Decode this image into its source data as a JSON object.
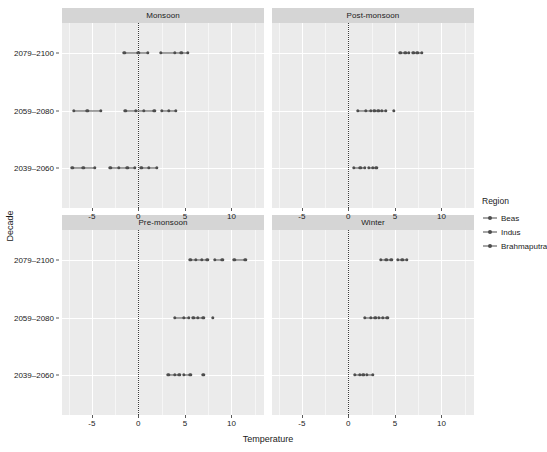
{
  "chart_data": {
    "type": "scatter",
    "title": "",
    "xlabel": "Temperature",
    "ylabel": "Decade",
    "xlim": [
      -8.2,
      13.5
    ],
    "ylim_categories": [
      "2039-2060",
      "2059-2080",
      "2079-2100"
    ],
    "xticks": [
      -5,
      0,
      5,
      10
    ],
    "xtick_labels": [
      "-5",
      "0",
      "5",
      "10"
    ],
    "yticks": [
      "2039–2060",
      "2059–2080",
      "2079–2100"
    ],
    "grid": true,
    "legend_position": "right",
    "legend_title": "Region",
    "reference_line": {
      "x": 0,
      "style": "dotted"
    },
    "facets": [
      {
        "label": "Monsoon",
        "row": 0,
        "col": 0,
        "rows": [
          {
            "decade": "2079–2100",
            "series": [
              {
                "name": "Beas",
                "values": [
                  -1.5,
                  0.0,
                  1.0
                ]
              },
              {
                "name": "Indus",
                "values": [
                  2.4,
                  3.9,
                  4.6,
                  5.3
                ]
              }
            ]
          },
          {
            "decade": "2059–2080",
            "series": [
              {
                "name": "Beas",
                "values": [
                  -6.9,
                  -5.5,
                  -4.0
                ]
              },
              {
                "name": "Indus",
                "values": [
                  -1.4,
                  -0.3,
                  0.6,
                  1.7
                ]
              },
              {
                "name": "Brahmaputra",
                "values": [
                  2.5,
                  3.3,
                  4.0
                ]
              }
            ]
          },
          {
            "decade": "2039–2060",
            "series": [
              {
                "name": "Beas",
                "values": [
                  -7.1,
                  -5.9,
                  -4.7
                ]
              },
              {
                "name": "Indus",
                "values": [
                  -3.0,
                  -2.1,
                  -1.2,
                  -0.4
                ]
              },
              {
                "name": "Brahmaputra",
                "values": [
                  0.3,
                  1.1,
                  2.0
                ]
              }
            ]
          }
        ]
      },
      {
        "label": "Post-monsoon",
        "row": 0,
        "col": 1,
        "rows": [
          {
            "decade": "2079–2100",
            "series": [
              {
                "name": "Beas",
                "values": [
                  5.6,
                  6.1,
                  6.5
                ]
              },
              {
                "name": "Indus",
                "values": [
                  7.0,
                  7.4,
                  7.9
                ]
              }
            ]
          },
          {
            "decade": "2059–2080",
            "series": [
              {
                "name": "Beas",
                "values": [
                  1.0,
                  1.9,
                  2.4
                ]
              },
              {
                "name": "Indus",
                "values": [
                  2.8,
                  3.2,
                  3.6,
                  4.0
                ]
              },
              {
                "name": "Brahmaputra",
                "values": [
                  4.9
                ]
              }
            ]
          },
          {
            "decade": "2039–2060",
            "series": [
              {
                "name": "Beas",
                "values": [
                  0.6,
                  1.3,
                  1.8
                ]
              },
              {
                "name": "Indus",
                "values": [
                  2.2,
                  2.6,
                  3.0
                ]
              }
            ]
          }
        ]
      },
      {
        "label": "Pre-monsoon",
        "row": 1,
        "col": 0,
        "rows": [
          {
            "decade": "2079–2100",
            "series": [
              {
                "name": "Beas",
                "values": [
                  5.6,
                  6.2,
                  6.8,
                  7.4
                ]
              },
              {
                "name": "Indus",
                "values": [
                  8.2,
                  9.0
                ]
              },
              {
                "name": "Brahmaputra",
                "values": [
                  10.3,
                  11.5
                ]
              }
            ]
          },
          {
            "decade": "2059–2080",
            "series": [
              {
                "name": "Beas",
                "values": [
                  3.9,
                  4.9,
                  5.4
                ]
              },
              {
                "name": "Indus",
                "values": [
                  5.9,
                  6.4,
                  7.0
                ]
              },
              {
                "name": "Brahmaputra",
                "values": [
                  8.0
                ]
              }
            ]
          },
          {
            "decade": "2039–2060",
            "series": [
              {
                "name": "Beas",
                "values": [
                  3.2,
                  3.9,
                  4.4
                ]
              },
              {
                "name": "Indus",
                "values": [
                  4.9,
                  5.6
                ]
              },
              {
                "name": "Brahmaputra",
                "values": [
                  7.0
                ]
              }
            ]
          }
        ]
      },
      {
        "label": "Winter",
        "row": 1,
        "col": 1,
        "rows": [
          {
            "decade": "2079–2100",
            "series": [
              {
                "name": "Beas",
                "values": [
                  3.5,
                  4.1,
                  4.6
                ]
              },
              {
                "name": "Indus",
                "values": [
                  5.3,
                  5.8,
                  6.3
                ]
              }
            ]
          },
          {
            "decade": "2059–2080",
            "series": [
              {
                "name": "Beas",
                "values": [
                  1.8,
                  2.4,
                  2.9
                ]
              },
              {
                "name": "Indus",
                "values": [
                  3.3,
                  3.7,
                  4.2
                ]
              }
            ]
          },
          {
            "decade": "2039–2060",
            "series": [
              {
                "name": "Beas",
                "values": [
                  0.7,
                  1.2,
                  1.6
                ]
              },
              {
                "name": "Indus",
                "values": [
                  2.0,
                  2.6
                ]
              }
            ]
          }
        ]
      }
    ]
  },
  "legend": {
    "title": "Region",
    "items": [
      {
        "label": "Beas",
        "color": "#4d4d4d"
      },
      {
        "label": "Indus",
        "color": "#4d4d4d"
      },
      {
        "label": "Brahmaputra",
        "color": "#4d4d4d"
      }
    ]
  },
  "theme": {
    "panel_background": "#ebebeb",
    "strip_background": "#d5d5d5",
    "gridline_color": "#ffffff",
    "point_color": "#4d4d4d",
    "reference_line_color": "#3a3a3a",
    "text_color": "#1a1a1a"
  }
}
